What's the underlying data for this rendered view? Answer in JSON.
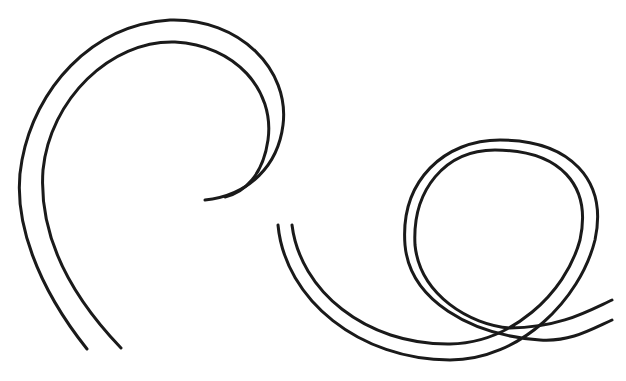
{
  "figure": {
    "background": "#ffffff",
    "stroke_color": "#1a1a1a",
    "stroke_width": 3
  },
  "shapes": [
    {
      "name": "left-spiral-outer"
    },
    {
      "name": "left-spiral-inner"
    },
    {
      "name": "right-loop-outer"
    },
    {
      "name": "right-loop-inner"
    }
  ]
}
